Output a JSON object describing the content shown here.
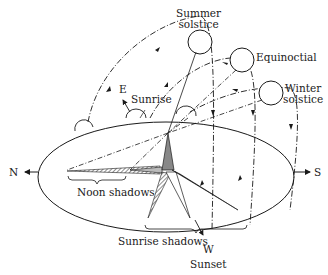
{
  "diagram": {
    "labels": {
      "summer_solstice_line1": "Summer",
      "summer_solstice_line2": "solstice",
      "equinoctial": "Equinoctial",
      "winter_solstice_line1": "Winter",
      "winter_solstice_line2": "solstice",
      "east": "E",
      "sunrise": "Sunrise",
      "north": "N",
      "south": "S",
      "west": "W",
      "sunset": "Sunset",
      "noon_shadows": "Noon shadows",
      "sunrise_shadows": "Sunrise shadows"
    },
    "sun_positions": [
      "summer-solstice",
      "equinoctial",
      "winter-solstice"
    ],
    "colors": {
      "ink": "#1a1a1a",
      "shadow_dark": "#111111",
      "shadow_mid": "#777777",
      "background": "#ffffff"
    }
  }
}
